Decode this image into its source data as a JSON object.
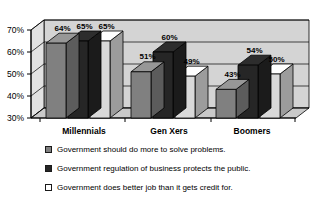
{
  "chart_data": {
    "type": "bar",
    "title": "",
    "subtitle": "",
    "xlabel": "",
    "ylabel": "",
    "categories": [
      "Millennials",
      "Gen Xers",
      "Boomers"
    ],
    "series": [
      {
        "name": "Government should do more to solve problems.",
        "color": "#808080",
        "values": [
          64,
          65,
          43
        ],
        "labels": [
          "64%",
          "51%",
          "43%"
        ]
      },
      {
        "name": "Government regulation of business protects the public.",
        "color": "#262626",
        "values": [
          65,
          60,
          54
        ],
        "labels": [
          "65%",
          "60%",
          "54%"
        ]
      },
      {
        "name": "Government does better job than it gets credit for.",
        "color": "#d9d9d9",
        "values": [
          65,
          49,
          50
        ],
        "labels": [
          "65%",
          "49%",
          "50%"
        ]
      }
    ],
    "series_values_by_category": {
      "Millennials": [
        64,
        65,
        65
      ],
      "Gen Xers": [
        51,
        60,
        49
      ],
      "Boomers": [
        43,
        54,
        50
      ]
    },
    "ylim": [
      30,
      70
    ],
    "yticks": [
      30,
      40,
      50,
      60,
      70
    ],
    "ytick_labels": [
      "30%",
      "40%",
      "50%",
      "60%",
      "70%"
    ],
    "grid": true,
    "legend_position": "bottom",
    "style": "3d-bar",
    "value_labels_shown": true,
    "colors": {
      "wall": "#d4d4d4",
      "floor": "#c9c9c9",
      "axis": "#000000",
      "gridline": "#000000",
      "background": "#ffffff"
    }
  },
  "legend": {
    "items": [
      {
        "label": "Government should do more to solve problems.",
        "color": "#808080"
      },
      {
        "label": "Government regulation of business protects the public.",
        "color": "#262626"
      },
      {
        "label": "Government does better job than it gets credit for.",
        "color": "#ffffff"
      }
    ]
  }
}
